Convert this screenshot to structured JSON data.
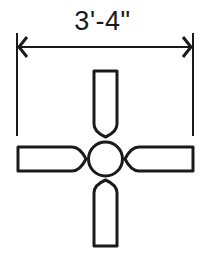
{
  "diagram": {
    "dimension": {
      "label": "3'-4\"",
      "from_x": 17,
      "to_x": 193,
      "line_y": 47
    },
    "fan": {
      "center": [
        105,
        159
      ],
      "hub_radius": 17,
      "blades": [
        {
          "name": "top",
          "x": 93,
          "y": 70,
          "w": 25,
          "h": 67
        },
        {
          "name": "bottom",
          "x": 93,
          "y": 180,
          "w": 25,
          "h": 67
        },
        {
          "name": "left",
          "x": 17,
          "y": 146,
          "w": 68,
          "h": 26
        },
        {
          "name": "right",
          "x": 125,
          "y": 146,
          "w": 69,
          "h": 26
        }
      ]
    },
    "colors": {
      "stroke": "#1a1a1a",
      "background": "#ffffff"
    }
  }
}
